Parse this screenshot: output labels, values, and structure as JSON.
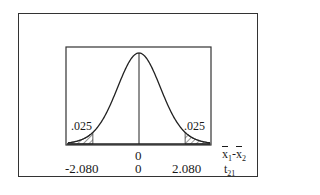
{
  "chart_data": {
    "type": "area",
    "title": "",
    "distribution": "t",
    "degrees_of_freedom": 21,
    "xlabel": [
      "x̄1-x̄2",
      "t21"
    ],
    "ylabel": "",
    "xlim": [
      -3.2,
      3.2
    ],
    "grid": false,
    "center_line": 0,
    "critical_values": [
      -2.08,
      2.08
    ],
    "tail_areas": [
      {
        "side": "left",
        "label": ".025",
        "value": 0.025
      },
      {
        "side": "right",
        "label": ".025",
        "value": 0.025
      }
    ],
    "axis_rows": [
      {
        "name": "x̄1-x̄2",
        "ticks": [
          "0"
        ]
      },
      {
        "name": "t21",
        "ticks": [
          "-2.080",
          "0",
          "2.080"
        ]
      }
    ]
  },
  "labels": {
    "left_tail": ".025",
    "right_tail": ".025",
    "row1_center": "0",
    "row2_left": "-2.080",
    "row2_center": "0",
    "row2_right": "2.080",
    "row1_axis_x": "x",
    "row1_axis_sub1": "1",
    "row1_axis_dash": "-",
    "row1_axis_x2": "x",
    "row1_axis_sub2": "2",
    "row2_axis_t": "t",
    "row2_axis_sub": "21"
  }
}
